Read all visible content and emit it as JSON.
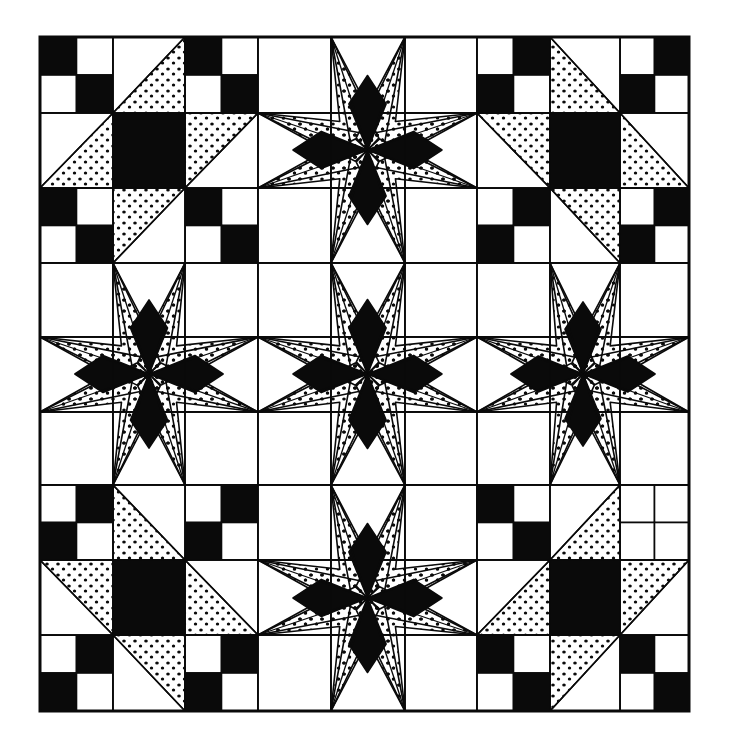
{
  "colors": {
    "ink": "#0a0a0a",
    "paper": "#ffffff"
  },
  "grid": {
    "x": [
      40,
      113,
      185,
      258,
      331,
      405,
      477,
      550,
      620,
      689
    ],
    "y": [
      37,
      113,
      188,
      263,
      337,
      412,
      485,
      560,
      635,
      711
    ]
  },
  "blocks": [
    {
      "row": 0,
      "col": 0,
      "type": "ohio-star",
      "diagonal": "slash",
      "four_patch": [
        "black-tl-br",
        "black-tl-br",
        "black-tl-br",
        "black-tl-br"
      ]
    },
    {
      "row": 0,
      "col": 1,
      "type": "eight-point-star"
    },
    {
      "row": 0,
      "col": 2,
      "type": "ohio-star",
      "diagonal": "backslash",
      "four_patch": [
        "black-tr-bl",
        "black-tr-bl",
        "black-tr-bl",
        "black-tr-bl"
      ]
    },
    {
      "row": 1,
      "col": 0,
      "type": "eight-point-star"
    },
    {
      "row": 1,
      "col": 1,
      "type": "eight-point-star"
    },
    {
      "row": 1,
      "col": 2,
      "type": "eight-point-star"
    },
    {
      "row": 2,
      "col": 0,
      "type": "ohio-star",
      "diagonal": "backslash",
      "four_patch": [
        "black-tr-bl",
        "black-tr-bl",
        "black-tr-bl",
        "black-tr-bl"
      ]
    },
    {
      "row": 2,
      "col": 1,
      "type": "eight-point-star"
    },
    {
      "row": 2,
      "col": 2,
      "type": "ohio-star",
      "diagonal": "slash",
      "four_patch": [
        "black-tl-br",
        "blank",
        "black-tl-br",
        "black-tl-br"
      ]
    }
  ]
}
